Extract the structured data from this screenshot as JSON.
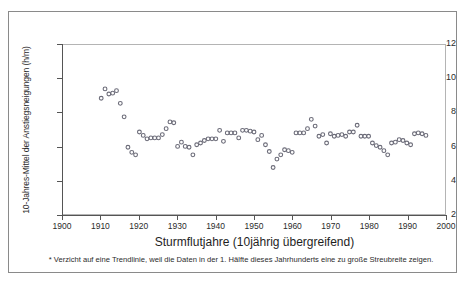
{
  "figure": {
    "frame_color": "#8a8a8a",
    "background": "#ffffff",
    "marker_color": "#6b6b78"
  },
  "axes": {
    "y_title": "10-Jahres-Mittel der Anstiegsneigungen (h/m)",
    "x_title": "Sturmflutjahre (10jährig übergreifend)",
    "y_ticks": [
      "2",
      "4",
      "6",
      "8",
      "10",
      "12"
    ],
    "x_ticks": [
      "1900",
      "1910",
      "1920",
      "1930",
      "1940",
      "1950",
      "1960",
      "1970",
      "1980",
      "1990",
      "2000"
    ]
  },
  "footnote": "* Verzicht auf eine Trendlinie, weil die Daten in der 1. Hälfte dieses Jahrhunderts eine zu große Streubreite zeigen.",
  "chart_data": {
    "type": "scatter",
    "title": "",
    "xlabel": "Sturmflutjahre (10jährig übergreifend)",
    "ylabel": "10-Jahres-Mittel der Anstiegsneigungen (h/m)",
    "xlim": [
      1900,
      2000
    ],
    "ylim": [
      2,
      12
    ],
    "grid": false,
    "legend": "none",
    "marker": "open-circle",
    "x": [
      1910,
      1911,
      1912,
      1913,
      1914,
      1915,
      1916,
      1917,
      1918,
      1919,
      1920,
      1921,
      1922,
      1923,
      1924,
      1925,
      1926,
      1927,
      1928,
      1929,
      1930,
      1931,
      1932,
      1933,
      1934,
      1935,
      1936,
      1937,
      1938,
      1939,
      1940,
      1941,
      1942,
      1943,
      1944,
      1945,
      1946,
      1947,
      1948,
      1949,
      1950,
      1951,
      1952,
      1953,
      1954,
      1955,
      1956,
      1957,
      1958,
      1959,
      1960,
      1961,
      1962,
      1963,
      1964,
      1965,
      1966,
      1967,
      1968,
      1969,
      1970,
      1971,
      1972,
      1973,
      1974,
      1975,
      1976,
      1977,
      1978,
      1979,
      1980,
      1981,
      1982,
      1983,
      1984,
      1985,
      1986,
      1987,
      1988,
      1989,
      1990,
      1991,
      1992,
      1993,
      1994,
      1995
    ],
    "y": [
      8.85,
      9.4,
      9.1,
      9.15,
      9.3,
      8.55,
      7.75,
      5.95,
      5.65,
      5.5,
      6.85,
      6.65,
      6.45,
      6.5,
      6.5,
      6.5,
      6.7,
      7.05,
      7.45,
      7.4,
      6.0,
      6.25,
      6.0,
      5.95,
      5.5,
      6.1,
      6.2,
      6.35,
      6.45,
      6.45,
      6.45,
      6.95,
      6.3,
      6.8,
      6.8,
      6.8,
      6.5,
      6.95,
      6.95,
      6.9,
      6.85,
      6.4,
      6.65,
      6.1,
      5.7,
      4.75,
      5.25,
      5.5,
      5.8,
      5.75,
      5.65,
      6.8,
      6.8,
      6.8,
      7.05,
      7.6,
      7.2,
      6.6,
      6.7,
      6.2,
      6.75,
      6.6,
      6.65,
      6.7,
      6.6,
      6.85,
      6.85,
      7.25,
      6.6,
      6.6,
      6.6,
      6.2,
      6.05,
      5.95,
      5.75,
      5.5,
      6.2,
      6.25,
      6.4,
      6.35,
      6.2,
      6.1,
      6.75,
      6.8,
      6.75,
      6.65
    ]
  }
}
